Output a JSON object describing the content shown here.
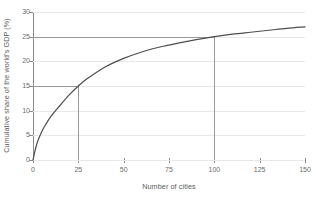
{
  "chart_data": {
    "type": "line",
    "title": "",
    "xlabel": "Number of cities",
    "ylabel": "Cumulative share of the world's GDP (%)",
    "xlim": [
      0,
      150
    ],
    "ylim": [
      0,
      30
    ],
    "xticks": [
      0,
      25,
      50,
      75,
      100,
      125,
      150
    ],
    "yticks": [
      0,
      5,
      10,
      15,
      20,
      25,
      30
    ],
    "xtick_labels": [
      "0",
      "25",
      "50",
      "75",
      "100",
      "125",
      "150"
    ],
    "ytick_labels": [
      "0",
      "5",
      "10",
      "15",
      "20",
      "25",
      "30"
    ],
    "grid": "horizontal",
    "legend": "none",
    "series": [
      {
        "name": "Cumulative GDP share",
        "color": "#4d4d4d",
        "x": [
          0,
          1,
          2,
          3,
          5,
          7,
          10,
          15,
          20,
          25,
          30,
          40,
          50,
          60,
          70,
          80,
          90,
          100,
          110,
          120,
          130,
          140,
          150
        ],
        "values": [
          0,
          1.7,
          3.1,
          4.2,
          5.9,
          7.2,
          8.9,
          11.1,
          13.2,
          15.0,
          16.5,
          18.9,
          20.6,
          21.9,
          22.9,
          23.7,
          24.4,
          25.0,
          25.5,
          25.9,
          26.3,
          26.7,
          27.0
        ]
      }
    ],
    "reference_lines": [
      {
        "name": "25-cities-marker",
        "x": 25,
        "y": 15,
        "color": "#9a9a9a"
      },
      {
        "name": "100-cities-marker",
        "x": 100,
        "y": 25,
        "color": "#9a9a9a"
      }
    ],
    "annotations": []
  }
}
